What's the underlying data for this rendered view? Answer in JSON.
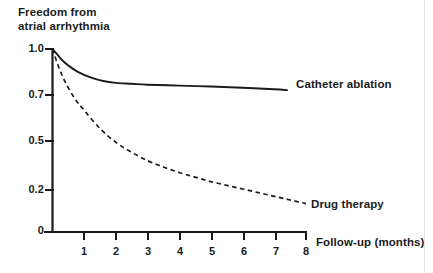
{
  "chart_data": {
    "type": "line",
    "title": "",
    "subtitle": "",
    "xlabel": "Follow-up (months)",
    "ylabel_line1": "Freedom from",
    "ylabel_line2": "atrial arrhythmia",
    "xlim": [
      0,
      8
    ],
    "ylim": [
      0,
      1.0
    ],
    "grid": false,
    "legend_position": "inline-right-of-curves",
    "xticks": [
      1,
      2,
      3,
      4,
      5,
      6,
      7,
      8
    ],
    "xtick_labels": [
      "1",
      "2",
      "3",
      "4",
      "5",
      "6",
      "7",
      "8"
    ],
    "yticks": [
      0,
      0.2,
      0.5,
      0.7,
      1.0
    ],
    "ytick_labels": [
      "0",
      "0.2",
      "0.5",
      "0.7",
      "1.0"
    ],
    "series": [
      {
        "name": "Catheter ablation",
        "style": "solid",
        "color": "#1b1b1b",
        "x": [
          0.0,
          0.15,
          0.3,
          0.5,
          0.8,
          1.2,
          1.6,
          2.0,
          2.5,
          3.0,
          4.0,
          5.0,
          6.0,
          7.0,
          7.4
        ],
        "y": [
          1.0,
          0.97,
          0.94,
          0.91,
          0.875,
          0.845,
          0.825,
          0.815,
          0.81,
          0.805,
          0.8,
          0.795,
          0.788,
          0.78,
          0.775
        ]
      },
      {
        "name": "Drug therapy",
        "style": "dashed",
        "color": "#1b1b1b",
        "x": [
          0.0,
          0.2,
          0.4,
          0.7,
          1.0,
          1.5,
          2.0,
          2.5,
          3.0,
          3.5,
          4.0,
          4.5,
          5.0,
          5.5,
          6.0,
          6.5,
          7.0,
          7.5,
          8.0
        ],
        "y": [
          1.0,
          0.9,
          0.82,
          0.73,
          0.665,
          0.565,
          0.49,
          0.435,
          0.39,
          0.355,
          0.325,
          0.3,
          0.275,
          0.255,
          0.235,
          0.215,
          0.195,
          0.175,
          0.155
        ]
      }
    ],
    "annotations": [
      {
        "text": "Catheter ablation",
        "attached_to": "Catheter ablation"
      },
      {
        "text": "Drug therapy",
        "attached_to": "Drug therapy"
      }
    ]
  },
  "axis": {
    "line_color": "#1b1b1b"
  }
}
